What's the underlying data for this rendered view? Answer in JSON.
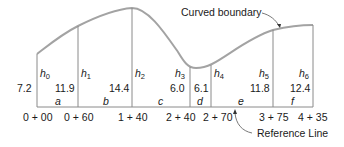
{
  "diagram": {
    "annotations": {
      "curved_boundary": "Curved boundary",
      "reference_line": "Reference Line"
    },
    "offsets": [
      {
        "name": "h",
        "sub": "0",
        "value": "7.2",
        "station": "0 + 00"
      },
      {
        "name": "h",
        "sub": "1",
        "value": "11.9",
        "station": "0 + 60"
      },
      {
        "name": "h",
        "sub": "2",
        "value": "14.4",
        "station": "1 + 40"
      },
      {
        "name": "h",
        "sub": "3",
        "value": "6.0",
        "station": "2 + 40"
      },
      {
        "name": "h",
        "sub": "4",
        "value": "6.1",
        "station": "2 + 70"
      },
      {
        "name": "h",
        "sub": "5",
        "value": "11.8",
        "station": "3 + 75"
      },
      {
        "name": "h",
        "sub": "6",
        "value": "12.4",
        "station": "4 + 35"
      }
    ],
    "segments": [
      "a",
      "b",
      "c",
      "d",
      "e",
      "f"
    ],
    "colors": {
      "curve": "#a0a0a0",
      "lines": "#8a8a8a",
      "text": "#1a1a1a"
    }
  }
}
